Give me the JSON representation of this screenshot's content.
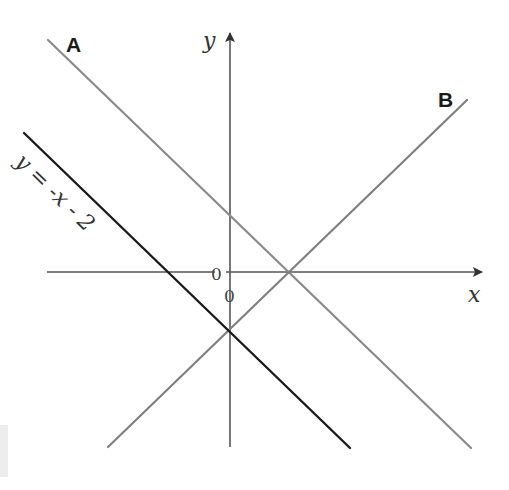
{
  "diagram": {
    "axes": {
      "x_label": "x",
      "y_label": "y",
      "origin_label_left": "0",
      "origin_label_below": "0",
      "axis_color": "#555555"
    },
    "lines": [
      {
        "id": "A",
        "label": "A",
        "color": "#8a8a8a",
        "slope_sign": "negative",
        "description": "Grey line sloping down, parallel to y = -x - 2, crossing positive y-axis"
      },
      {
        "id": "B",
        "label": "B",
        "color": "#808080",
        "slope_sign": "positive",
        "description": "Grey line sloping up, meeting line A on the positive x-axis and y = -x - 2 on the negative y-axis"
      },
      {
        "id": "given",
        "label": "y = -x - 2",
        "label_parts": [
          "y",
          "=",
          "-",
          "x",
          "-",
          "2"
        ],
        "color": "#1a1a1a",
        "slope_sign": "negative",
        "equation": "y = -x - 2"
      }
    ],
    "intersections": [
      {
        "lines": [
          "A",
          "B"
        ],
        "location": "on positive x-axis"
      },
      {
        "lines": [
          "B",
          "given"
        ],
        "location": "on negative y-axis"
      }
    ]
  }
}
